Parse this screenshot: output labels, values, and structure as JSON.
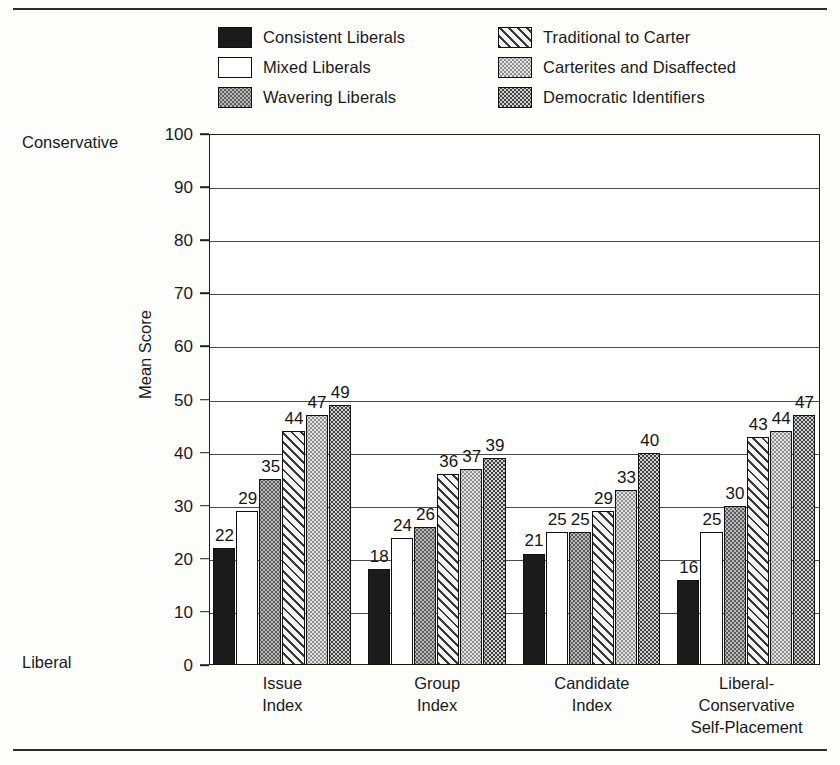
{
  "figure": {
    "axis_title": "Mean Score",
    "top_note": "Conservative",
    "bottom_note": "Liberal"
  },
  "legend": {
    "items": [
      {
        "label": "Consistent Liberals",
        "pattern": "solid-black",
        "column": "left"
      },
      {
        "label": "Mixed Liberals",
        "pattern": "white",
        "column": "left"
      },
      {
        "label": "Wavering Liberals",
        "pattern": "mid-dot",
        "column": "left"
      },
      {
        "label": "Traditional to Carter",
        "pattern": "hatch",
        "column": "right"
      },
      {
        "label": "Carterites and Disaffected",
        "pattern": "light-dot",
        "column": "right"
      },
      {
        "label": "Democratic Identifiers",
        "pattern": "dark-dot",
        "column": "right"
      }
    ]
  },
  "chart_data": {
    "type": "bar",
    "title": "",
    "xlabel": "",
    "ylabel": "Mean Score",
    "ylim": [
      0,
      100
    ],
    "yticks": [
      0,
      10,
      20,
      30,
      40,
      50,
      60,
      70,
      80,
      90,
      100
    ],
    "grid": true,
    "legend_position": "top",
    "annotations": [
      "Conservative",
      "Liberal"
    ],
    "categories": [
      "Issue\nIndex",
      "Group\nIndex",
      "Candidate\nIndex",
      "Liberal-\nConservative\nSelf-Placement"
    ],
    "category_lines": [
      [
        "Issue",
        "Index"
      ],
      [
        "Group",
        "Index"
      ],
      [
        "Candidate",
        "Index"
      ],
      [
        "Liberal-",
        "Conservative",
        "Self-Placement"
      ]
    ],
    "series": [
      {
        "name": "Consistent Liberals",
        "pattern": "solid-black",
        "values": [
          22,
          18,
          21,
          16
        ]
      },
      {
        "name": "Mixed Liberals",
        "pattern": "white",
        "values": [
          29,
          24,
          25,
          25
        ]
      },
      {
        "name": "Wavering Liberals",
        "pattern": "mid-dot",
        "values": [
          35,
          26,
          25,
          30
        ]
      },
      {
        "name": "Traditional to Carter",
        "pattern": "hatch",
        "values": [
          44,
          36,
          29,
          43
        ]
      },
      {
        "name": "Carterites and Disaffected",
        "pattern": "light-dot",
        "values": [
          47,
          37,
          33,
          44
        ]
      },
      {
        "name": "Democratic Identifiers",
        "pattern": "dark-dot",
        "values": [
          49,
          39,
          40,
          47
        ]
      }
    ]
  }
}
